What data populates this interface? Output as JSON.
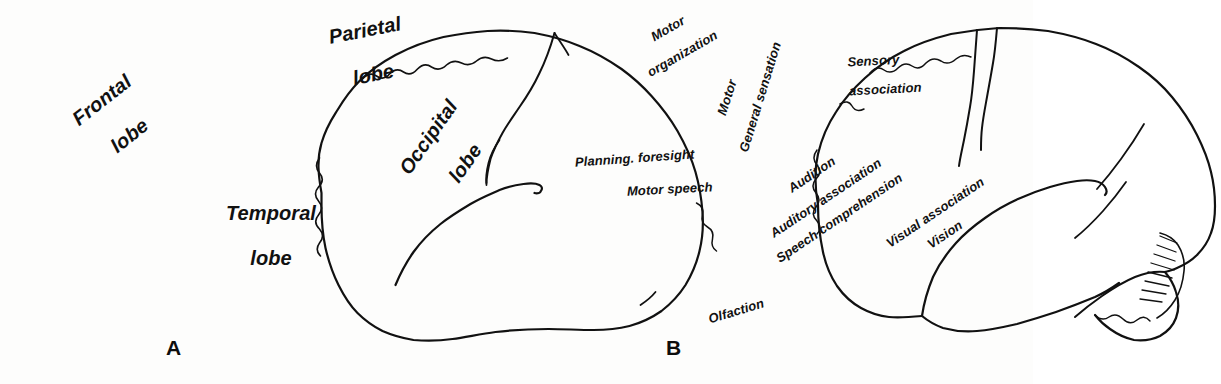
{
  "figure": {
    "background_color": "#fdfdfc",
    "ink_color": "#111111"
  },
  "panels": [
    {
      "letter": "A",
      "name": "lobes-of-the-brain",
      "labels": [
        {
          "id": "frontal-lobe",
          "lines": [
            "Frontal",
            "lobe"
          ],
          "x": 62,
          "y": 160,
          "rotation": -38,
          "font_size": 20
        },
        {
          "id": "parietal-lobe",
          "lines": [
            "Parietal",
            "lobe"
          ],
          "x": 300,
          "y": 66,
          "rotation": -11,
          "font_size": 20
        },
        {
          "id": "temporal-lobe",
          "lines": [
            "Temporal",
            "lobe"
          ],
          "x": 192,
          "y": 236,
          "rotation": 0,
          "font_size": 20
        },
        {
          "id": "occipital-lobe",
          "lines": [
            "Occipital",
            "lobe"
          ],
          "x": 403,
          "y": 213,
          "rotation": -55,
          "font_size": 20
        }
      ]
    },
    {
      "letter": "B",
      "name": "functional-areas-of-the-brain",
      "labels": [
        {
          "id": "motor-organization",
          "lines": [
            "Motor",
            "organization"
          ],
          "x": 622,
          "y": 72,
          "rotation": -30,
          "font_size": 13
        },
        {
          "id": "motor",
          "lines": [
            "Motor"
          ],
          "x": 722,
          "y": 115,
          "rotation": -72,
          "font_size": 13
        },
        {
          "id": "general-sensation",
          "lines": [
            "General sensation"
          ],
          "x": 744,
          "y": 152,
          "rotation": -73,
          "font_size": 13
        },
        {
          "id": "sensory-association",
          "lines": [
            "Sensory",
            "association"
          ],
          "x": 826,
          "y": 78,
          "rotation": -3,
          "font_size": 13
        },
        {
          "id": "planning-foresight",
          "lines": [
            "Planning. foresight"
          ],
          "x": 575,
          "y": 163,
          "rotation": -4,
          "font_size": 13
        },
        {
          "id": "motor-speech",
          "lines": [
            "Motor speech"
          ],
          "x": 627,
          "y": 192,
          "rotation": -3,
          "font_size": 13
        },
        {
          "id": "audition",
          "lines": [
            "Audition"
          ],
          "x": 790,
          "y": 190,
          "rotation": -34,
          "font_size": 13
        },
        {
          "id": "auditory-association",
          "lines": [
            "Auditory association"
          ],
          "x": 772,
          "y": 235,
          "rotation": -34,
          "font_size": 13
        },
        {
          "id": "speech-comprehension",
          "lines": [
            "Speech comprehension"
          ],
          "x": 778,
          "y": 260,
          "rotation": -34,
          "font_size": 13
        },
        {
          "id": "visual-association",
          "lines": [
            "Visual association"
          ],
          "x": 888,
          "y": 245,
          "rotation": -34,
          "font_size": 13
        },
        {
          "id": "vision",
          "lines": [
            "Vision"
          ],
          "x": 929,
          "y": 246,
          "rotation": -34,
          "font_size": 13
        },
        {
          "id": "olfaction",
          "lines": [
            "Olfaction"
          ],
          "x": 709,
          "y": 320,
          "rotation": -17,
          "font_size": 13
        }
      ]
    }
  ],
  "panel_letters": [
    {
      "text": "A",
      "x": 166,
      "y": 348
    },
    {
      "text": "B",
      "x": 666,
      "y": 348
    }
  ]
}
